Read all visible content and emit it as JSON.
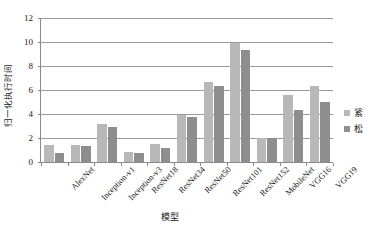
{
  "chart_data": {
    "type": "bar",
    "title": "",
    "xlabel": "模型",
    "ylabel": "归一化执行时间",
    "ylim": [
      0,
      12
    ],
    "ytick_labels": [
      "0",
      "2",
      "4",
      "6",
      "8",
      "10",
      "12"
    ],
    "yticks": [
      0,
      2,
      4,
      6,
      8,
      10,
      12
    ],
    "grid": "horizontal",
    "legend_position": "right",
    "categories": [
      "AlexNet",
      "Inception-v1",
      "Inception-v3",
      "ResNet18",
      "ResNet34",
      "ResNet50",
      "ResNet101",
      "ResNet152",
      "MobileNet",
      "VGG16",
      "VGG19"
    ],
    "series": [
      {
        "name": "紧",
        "color": "#b8b8b8",
        "values": [
          1.45,
          1.4,
          3.18,
          0.87,
          1.52,
          3.93,
          6.68,
          9.88,
          2.0,
          5.55,
          6.32
        ]
      },
      {
        "name": "松",
        "color": "#8e8e8e",
        "values": [
          0.78,
          1.32,
          2.88,
          0.78,
          1.15,
          3.72,
          6.35,
          9.35,
          1.98,
          4.35,
          5.03
        ]
      }
    ]
  },
  "legend": {
    "items": [
      {
        "label": "紧",
        "color": "#b8b8b8"
      },
      {
        "label": "松",
        "color": "#8e8e8e"
      }
    ]
  },
  "axes": {
    "y_title": "归一化执行时间",
    "x_title": "模型"
  },
  "colors": {
    "axis": "#8a8a8a",
    "gridline": "#9a9a9a",
    "text": "#1a1a1a",
    "background": "#ffffff",
    "series_tight": "#b8b8b8",
    "series_loose": "#8e8e8e"
  }
}
